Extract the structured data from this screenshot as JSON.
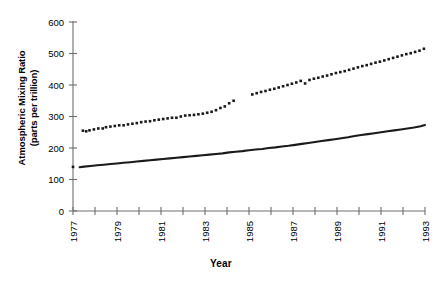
{
  "chart_data": {
    "type": "scatter",
    "title": "",
    "xlabel": "Year",
    "ylabel": "Atmospheric Mixing Ratio (parts per trillion)",
    "ylabel_line1": "Atmospheric Mixing Ratio",
    "ylabel_line2": "(parts per trillion)",
    "xlim": [
      1977,
      1993
    ],
    "ylim": [
      0,
      600
    ],
    "yticks": [
      0,
      100,
      200,
      300,
      400,
      500,
      600
    ],
    "ytick_labels": [
      "0",
      "100",
      "200",
      "300",
      "400",
      "500",
      "600"
    ],
    "xticks": [
      1977,
      1978,
      1979,
      1980,
      1981,
      1982,
      1983,
      1984,
      1985,
      1986,
      1987,
      1988,
      1989,
      1990,
      1991,
      1992,
      1993
    ],
    "xtick_labels": [
      "1977",
      "",
      "1979",
      "",
      "1981",
      "",
      "1983",
      "",
      "1985",
      "",
      "1987",
      "",
      "1989",
      "",
      "1991",
      "",
      "1993"
    ],
    "grid": false,
    "legend": "none",
    "series": [
      {
        "name": "dotted-upper-series",
        "style": "dotted",
        "marker": "square",
        "color": "#1a1a1a",
        "x": [
          1977.45,
          1977.6,
          1977.75,
          1977.95,
          1978.15,
          1978.35,
          1978.5,
          1978.7,
          1978.9,
          1979.1,
          1979.3,
          1979.5,
          1979.7,
          1979.9,
          1980.1,
          1980.3,
          1980.5,
          1980.7,
          1980.9,
          1981.1,
          1981.3,
          1981.5,
          1981.7,
          1981.9,
          1982.1,
          1982.3,
          1982.5,
          1982.7,
          1982.9,
          1983.1,
          1983.3,
          1983.5,
          1983.7,
          1983.9,
          1984.1,
          1984.3,
          1985.15,
          1985.35,
          1985.55,
          1985.75,
          1985.95,
          1986.15,
          1986.35,
          1986.55,
          1986.75,
          1986.95,
          1987.15,
          1987.35,
          1987.55,
          1987.75,
          1987.95,
          1988.15,
          1988.35,
          1988.55,
          1988.75,
          1988.95,
          1989.15,
          1989.35,
          1989.55,
          1989.75,
          1989.95,
          1990.15,
          1990.35,
          1990.55,
          1990.75,
          1990.95,
          1991.15,
          1991.35,
          1991.55,
          1991.75,
          1991.95,
          1992.15,
          1992.35,
          1992.55,
          1992.75,
          1992.95
        ],
        "y": [
          255,
          253,
          256,
          259,
          262,
          262,
          266,
          268,
          270,
          272,
          272,
          275,
          277,
          279,
          282,
          284,
          285,
          288,
          290,
          292,
          294,
          296,
          296,
          300,
          303,
          304,
          305,
          307,
          309,
          312,
          315,
          320,
          327,
          332,
          342,
          350,
          370,
          374,
          378,
          381,
          385,
          388,
          392,
          396,
          400,
          404,
          408,
          413,
          405,
          416,
          420,
          423,
          427,
          430,
          434,
          438,
          441,
          444,
          448,
          452,
          456,
          460,
          463,
          467,
          471,
          474,
          478,
          482,
          486,
          490,
          494,
          498,
          501,
          505,
          509,
          515
        ]
      },
      {
        "name": "solid-lower-series",
        "style": "solid",
        "color": "#1a1a1a",
        "x": [
          1977.3,
          1977.5,
          1977.8,
          1978.1,
          1978.4,
          1978.7,
          1979.0,
          1979.3,
          1979.6,
          1979.9,
          1980.2,
          1980.5,
          1980.8,
          1981.1,
          1981.4,
          1981.7,
          1982.0,
          1982.3,
          1982.6,
          1982.9,
          1983.2,
          1983.5,
          1983.8,
          1984.1,
          1984.4,
          1984.7,
          1985.0,
          1985.3,
          1985.6,
          1985.9,
          1986.2,
          1986.5,
          1986.8,
          1987.1,
          1987.4,
          1987.7,
          1988.0,
          1988.3,
          1988.6,
          1988.9,
          1989.2,
          1989.5,
          1989.8,
          1990.1,
          1990.4,
          1990.7,
          1991.0,
          1991.3,
          1991.6,
          1991.9,
          1992.2,
          1992.5,
          1992.8,
          1993.0
        ],
        "y": [
          139,
          141,
          143,
          145,
          147,
          149,
          151,
          153,
          155,
          157,
          159,
          161,
          163,
          165,
          167,
          169,
          171,
          173,
          175,
          177,
          179,
          181,
          183,
          186,
          188,
          190,
          193,
          195,
          197,
          200,
          202,
          205,
          207,
          210,
          213,
          216,
          219,
          222,
          225,
          228,
          231,
          234,
          238,
          241,
          244,
          247,
          250,
          253,
          256,
          259,
          262,
          265,
          269,
          273
        ]
      },
      {
        "name": "isolated-left-marker",
        "style": "points",
        "color": "#1a1a1a",
        "x": [
          1977.0
        ],
        "y": [
          140
        ]
      }
    ]
  }
}
